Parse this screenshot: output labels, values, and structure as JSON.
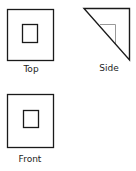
{
  "views": {
    "top": {
      "label": "Top"
    },
    "side": {
      "label": "Side"
    },
    "front": {
      "label": "Front"
    }
  },
  "colors": {
    "line": "#1a1a1a",
    "hidden_line": "#999999",
    "label": "#222222"
  }
}
